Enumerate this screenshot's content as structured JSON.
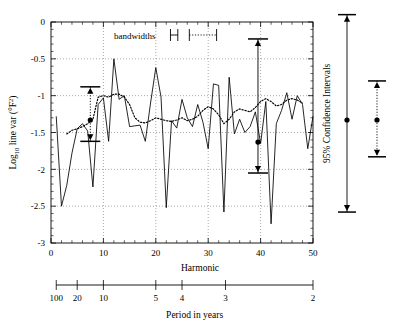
{
  "figure": {
    "legend_label": "bandwidths",
    "ci_panel_label": "95% Confidence Intervals"
  },
  "chart_data": {
    "type": "line",
    "title": "",
    "xlabel": "Harmonic",
    "ylabel": "Log10 line var (°F2)",
    "ylabel_parts": {
      "base": "Log",
      "sub": "10",
      "mid": " line var (°F",
      "sup": "2",
      "tail": ")"
    },
    "xlim": [
      0,
      50
    ],
    "ylim": [
      -3,
      0
    ],
    "xticks": [
      0,
      10,
      20,
      30,
      40,
      50
    ],
    "xticklabels": [
      "0",
      "10",
      "20",
      "30",
      "40",
      "50"
    ],
    "xtick_minor_step": 2,
    "yticks": [
      0,
      -0.5,
      -1,
      -1.5,
      -2,
      -2.5,
      -3
    ],
    "yticklabels": [
      "0",
      "-0.5",
      "-1",
      "-1.5",
      "-2",
      "-2.5",
      "-3"
    ],
    "grid": true,
    "grid_axis": "y",
    "vertical_gridlines_x": [
      10,
      20,
      30,
      40
    ],
    "legend_position": "top-center",
    "secondary_axis": {
      "label": "Period in years",
      "ticklabels": [
        "100",
        "20",
        "10",
        "5",
        "4",
        "3",
        "2"
      ],
      "tickvalues_harmonic": [
        1,
        5,
        10,
        20,
        25,
        33.3,
        50
      ]
    },
    "series": [
      {
        "name": "raw periodogram",
        "style": "solid",
        "x": [
          1,
          2,
          3,
          4,
          5,
          6,
          7,
          8,
          9,
          10,
          11,
          12,
          13,
          14,
          15,
          16,
          17,
          18,
          19,
          20,
          21,
          22,
          23,
          24,
          25,
          26,
          27,
          28,
          29,
          30,
          31,
          32,
          33,
          34,
          35,
          36,
          37,
          38,
          39,
          40,
          41,
          42,
          43,
          44,
          45,
          46,
          47,
          48,
          49,
          50
        ],
        "values": [
          -1.28,
          -2.5,
          -2.22,
          -1.78,
          -1.45,
          -1.38,
          -1.48,
          -2.24,
          -1.12,
          -1.03,
          -1.62,
          -0.5,
          -1.05,
          -1.0,
          -1.42,
          -1.41,
          -1.4,
          -1.62,
          -1.1,
          -0.62,
          -1.02,
          -2.52,
          -1.34,
          -1.44,
          -1.05,
          -1.3,
          -1.42,
          -1.12,
          -1.36,
          -1.72,
          -0.84,
          -0.86,
          -2.58,
          -0.75,
          -1.52,
          -1.32,
          -1.5,
          -1.42,
          -1.22,
          -1.65,
          -1.08,
          -2.74,
          -1.38,
          -1.2,
          -0.96,
          -1.32,
          -1.0,
          -1.12,
          -1.72,
          -1.28
        ]
      },
      {
        "name": "smoothed estimate",
        "style": "dotted",
        "x": [
          3,
          4,
          5,
          6,
          7,
          8,
          9,
          10,
          11,
          12,
          13,
          14,
          15,
          16,
          17,
          18,
          19,
          20,
          21,
          22,
          23,
          24,
          25,
          26,
          27,
          28,
          29,
          30,
          31,
          32,
          33,
          34,
          35,
          36,
          37,
          38,
          39,
          40,
          41,
          42,
          43,
          44,
          45,
          46,
          47,
          48
        ],
        "values": [
          -1.52,
          -1.47,
          -1.45,
          -1.42,
          -1.38,
          -1.32,
          -1.02,
          -1.0,
          -1.02,
          -0.98,
          -0.98,
          -1.02,
          -1.12,
          -1.3,
          -1.36,
          -1.37,
          -1.34,
          -1.3,
          -1.32,
          -1.34,
          -1.35,
          -1.33,
          -1.3,
          -1.34,
          -1.32,
          -1.28,
          -1.2,
          -1.15,
          -1.18,
          -1.26,
          -1.38,
          -1.32,
          -1.22,
          -1.18,
          -1.2,
          -1.22,
          -1.16,
          -1.08,
          -1.04,
          -1.08,
          -1.14,
          -1.12,
          -1.06,
          -1.04,
          -1.06,
          -1.1
        ]
      }
    ],
    "annotations": [
      {
        "name": "error-bar-left",
        "x": 7.5,
        "center": -1.33,
        "upper": -0.88,
        "lower": -1.62,
        "style": "dotted-with-arrows"
      },
      {
        "name": "error-bar-right",
        "x": 39.5,
        "center": -1.63,
        "upper": -0.23,
        "lower": -2.05,
        "style": "solid-with-arrows"
      }
    ],
    "bandwidth_legend": {
      "solid_bar": {
        "x_center": 23.5,
        "half_width": 0.7
      },
      "dotted_bar": {
        "x_center": 29.0,
        "half_width": 2.6
      }
    },
    "confidence_intervals": [
      {
        "name": "solid-ci",
        "style": "solid",
        "center": -1.33,
        "upper": 0.1,
        "lower": -2.58
      },
      {
        "name": "dotted-ci",
        "style": "dotted",
        "center": -1.33,
        "upper": -0.8,
        "lower": -1.83
      }
    ]
  }
}
